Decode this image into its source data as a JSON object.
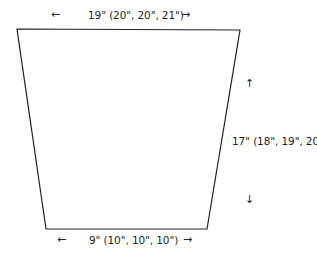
{
  "diagram": {
    "type": "trapezoid-schematic",
    "shape": {
      "points": {
        "top_left": [
          17,
          29
        ],
        "top_right": [
          240,
          30
        ],
        "bottom_right": [
          207,
          229
        ],
        "bottom_left": [
          46,
          229
        ]
      },
      "stroke_color": "#231f20",
      "fill_color": "#ffffff"
    },
    "dimensions": {
      "top_width": {
        "label": "19\" (20\", 20\", 21\")",
        "arrow_left": "←",
        "arrow_right": "→"
      },
      "bottom_width": {
        "label": "9\" (10\", 10\", 10\")",
        "arrow_left": "←",
        "arrow_right": "→"
      },
      "height": {
        "label": "17\" (18\", 19\", 20\")",
        "arrow_up": "↑",
        "arrow_down": "↓"
      }
    }
  }
}
